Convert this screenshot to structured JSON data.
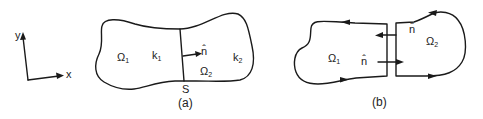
{
  "axes": {
    "x_label": "x",
    "y_label": "y"
  },
  "panel_a": {
    "caption": "(a)",
    "region1": {
      "symbol": "Ω",
      "subscript": "1"
    },
    "region2": {
      "symbol": "Ω",
      "subscript": "2"
    },
    "k1": {
      "symbol": "k",
      "subscript": "1"
    },
    "k2": {
      "symbol": "k",
      "subscript": "2"
    },
    "interface_label": "S",
    "normal_label": "n̂"
  },
  "panel_b": {
    "caption": "(b)",
    "region1": {
      "symbol": "Ω",
      "subscript": "1"
    },
    "region2": {
      "symbol": "Ω",
      "subscript": "2"
    },
    "normal_label_1": "n̂",
    "normal_label_2": "n̂"
  },
  "colors": {
    "ink": "#1a1a1a",
    "background": "#ffffff"
  }
}
